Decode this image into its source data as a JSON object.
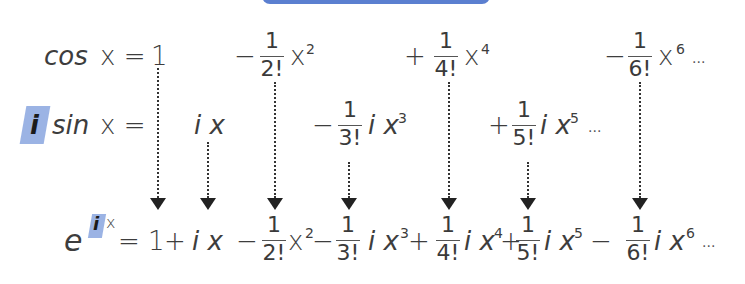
{
  "header_bar": {
    "color": "#5b7fd0"
  },
  "highlight_color": "#8aa6df",
  "rows": {
    "cos": {
      "lhs_func": "cos",
      "lhs_var": "x =",
      "terms": [
        {
          "sign": "",
          "num": "",
          "den": "",
          "body": "1",
          "power": ""
        },
        {
          "sign": "−",
          "num": "1",
          "den": "2!",
          "body": "x",
          "power": "2"
        },
        {
          "sign": "+",
          "num": "1",
          "den": "4!",
          "body": "x",
          "power": "4"
        },
        {
          "sign": "−",
          "num": "1",
          "den": "6!",
          "body": "x",
          "power": "6"
        }
      ],
      "ellipsis": "···"
    },
    "isin": {
      "lhs_i": "i",
      "lhs_func": "sin",
      "lhs_var": "x =",
      "terms": [
        {
          "sign": "",
          "num": "",
          "den": "",
          "body": "i x",
          "power": ""
        },
        {
          "sign": "−",
          "num": "1",
          "den": "3!",
          "body": "i x",
          "power": "3"
        },
        {
          "sign": "+",
          "num": "1",
          "den": "5!",
          "body": "i x",
          "power": "5"
        }
      ],
      "ellipsis": "···"
    },
    "exp": {
      "lhs_base": "e",
      "lhs_i": "i",
      "lhs_x": "x",
      "eq": "=",
      "t0": "1",
      "p1": "+",
      "t1": "i x",
      "m2": "−",
      "f2": {
        "num": "1",
        "den": "2!"
      },
      "x2": "x",
      "pw2": "2",
      "m3": "−",
      "f3": {
        "num": "1",
        "den": "3!"
      },
      "x3": "i x",
      "pw3": "3",
      "p4": "+",
      "f4": {
        "num": "1",
        "den": "4!"
      },
      "x4": "i x",
      "pw4": "4",
      "p5": "+",
      "f5": {
        "num": "1",
        "den": "5!"
      },
      "x5": "i x",
      "pw5": "5",
      "m6": "−",
      "f6": {
        "num": "1",
        "den": "6!"
      },
      "x6": "i x",
      "pw6": "6",
      "ellipsis": "···"
    }
  }
}
